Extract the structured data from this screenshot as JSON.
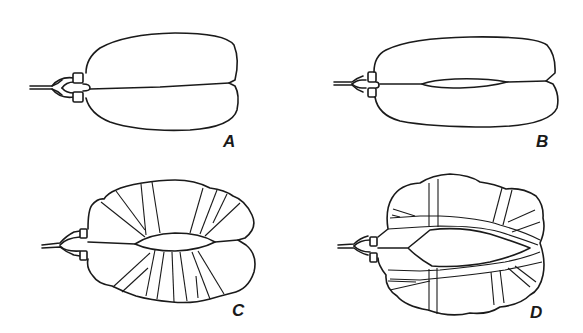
{
  "figure": {
    "panels": [
      {
        "id": "A",
        "label": "A",
        "description": "Bi-lobed sac with connector, closed midline"
      },
      {
        "id": "B",
        "label": "B",
        "description": "Elongated bi-lobed sac with narrow central slit"
      },
      {
        "id": "C",
        "label": "C",
        "description": "Rounded bi-lobed sac with open central lens and radial bands"
      },
      {
        "id": "D",
        "label": "D",
        "description": "Irregular sac with wide central opening and crossing bands"
      }
    ],
    "colors": {
      "stroke": "#1a1a1a",
      "background": "#ffffff"
    }
  }
}
